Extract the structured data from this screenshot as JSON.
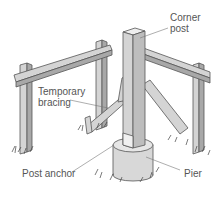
{
  "diagram": {
    "labels": {
      "corner_post": [
        "Corner",
        "post"
      ],
      "temporary_bracing": [
        "Temporary",
        "bracing"
      ],
      "post_anchor": "Post anchor",
      "pier": "Pier"
    },
    "colors": {
      "wood": "#d4d4d4",
      "wood_dark": "#a8a8a8",
      "outline": "#555555",
      "text": "#555555",
      "leader": "#777777"
    }
  }
}
